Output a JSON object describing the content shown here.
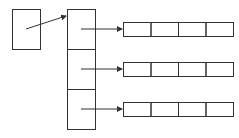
{
  "diagram": {
    "type": "pointer-array-of-arrays",
    "stroke_color": "#333333",
    "background": "#ffffff",
    "pointer_box": {
      "x": 12,
      "y": 9,
      "w": 28,
      "h": 40
    },
    "pointer_arrow": {
      "x1": 26,
      "y1": 29,
      "x2": 66,
      "y2": 16
    },
    "column": {
      "x": 67,
      "y": 9,
      "w": 28,
      "cell_h": 40,
      "cells": 3
    },
    "row_arrays": [
      {
        "y": 22,
        "arrow_y": 29
      },
      {
        "y": 62,
        "arrow_y": 69
      },
      {
        "y": 102,
        "arrow_y": 109
      }
    ],
    "row_array_x": 123,
    "row_array_cell_w": 27.5,
    "row_array_cell_h": 14,
    "row_array_cells": 4,
    "arrow_start_x": 81
  }
}
